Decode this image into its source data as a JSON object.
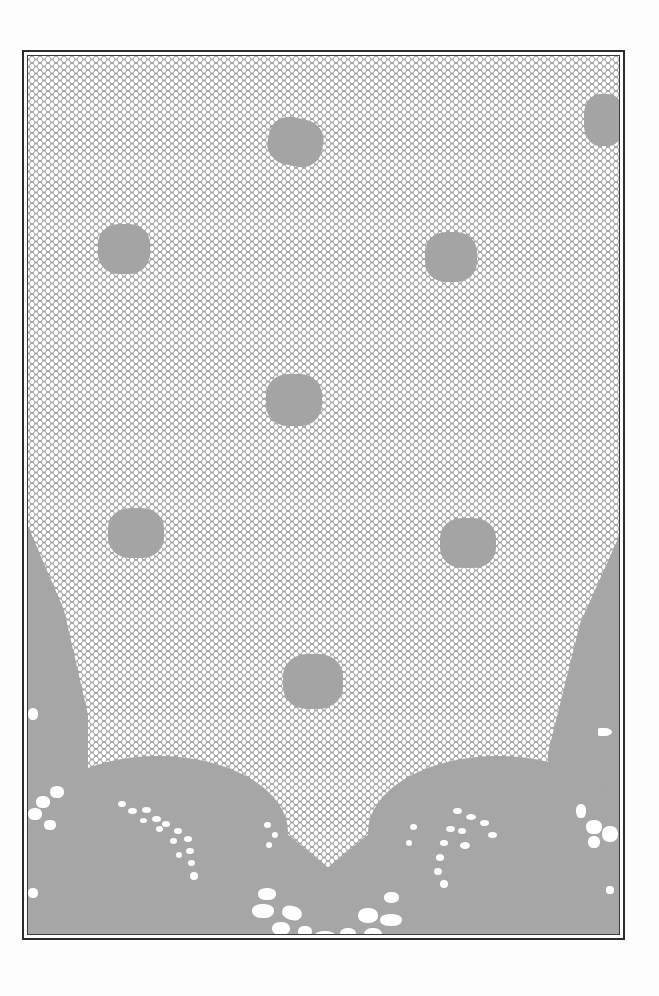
{
  "image": {
    "subject": "filet lace mesh panel with solid motifs and scalloped lower border",
    "colors": {
      "page_background": "#fdfdfd",
      "lace_gray": "#a6a6a6",
      "mesh_holes": "#ffffff",
      "frame_border": "#2b2b2b"
    },
    "motifs": [
      {
        "x": 268,
        "y": 115,
        "w": 55,
        "h": 45
      },
      {
        "x": 100,
        "y": 220,
        "w": 50,
        "h": 48
      },
      {
        "x": 425,
        "y": 232,
        "w": 50,
        "h": 48
      },
      {
        "x": 265,
        "y": 372,
        "w": 55,
        "h": 50
      },
      {
        "x": 110,
        "y": 510,
        "w": 55,
        "h": 50
      },
      {
        "x": 440,
        "y": 518,
        "w": 55,
        "h": 50
      },
      {
        "x": 280,
        "y": 655,
        "w": 60,
        "h": 55
      },
      {
        "x": 585,
        "y": 95,
        "w": 40,
        "h": 50
      }
    ]
  }
}
